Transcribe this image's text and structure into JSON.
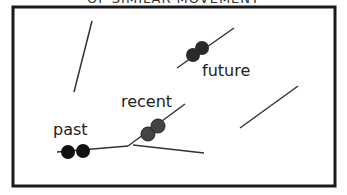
{
  "title": "OF SIMILAR MOVEMENT",
  "labels": {
    "past": "past",
    "recent": "recent",
    "future": "future"
  },
  "colors": {
    "frame": "#1a1a1a",
    "line": "#333333",
    "past_dots": "#111111",
    "recent_dots": "#444444",
    "future_dots": "#2a2a2a"
  }
}
